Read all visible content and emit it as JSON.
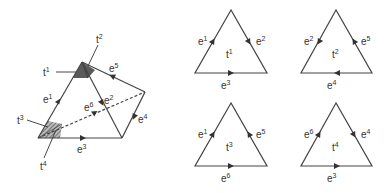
{
  "diagram": {
    "left_figure": {
      "vertices": {
        "A": [
          38,
          138
        ],
        "B": [
          82,
          62
        ],
        "C": [
          122,
          138
        ],
        "D": [
          145,
          92
        ]
      },
      "edges": [
        {
          "id": "e1",
          "label": "e",
          "sup": "1"
        },
        {
          "id": "e2",
          "label": "e",
          "sup": "2"
        },
        {
          "id": "e3",
          "label": "e",
          "sup": "3"
        },
        {
          "id": "e4",
          "label": "e",
          "sup": "4"
        },
        {
          "id": "e5",
          "label": "e",
          "sup": "5"
        },
        {
          "id": "e6",
          "label": "e",
          "sup": "6"
        }
      ],
      "corner_labels": [
        {
          "id": "t1",
          "label": "t",
          "sup": "1"
        },
        {
          "id": "t2",
          "label": "t",
          "sup": "2"
        },
        {
          "id": "t3",
          "label": "t",
          "sup": "3"
        },
        {
          "id": "t4",
          "label": "t",
          "sup": "4"
        }
      ]
    },
    "triangles": [
      {
        "name": "t",
        "sup": "1",
        "left": {
          "label": "e",
          "sup": "1"
        },
        "right": {
          "label": "e",
          "sup": "2"
        },
        "bottom": {
          "label": "e",
          "sup": "3"
        }
      },
      {
        "name": "t",
        "sup": "2",
        "left": {
          "label": "e",
          "sup": "2"
        },
        "right": {
          "label": "e",
          "sup": "5"
        },
        "bottom": {
          "label": "e",
          "sup": "4"
        }
      },
      {
        "name": "t",
        "sup": "3",
        "left": {
          "label": "e",
          "sup": "1"
        },
        "right": {
          "label": "e",
          "sup": "5"
        },
        "bottom": {
          "label": "e",
          "sup": "6"
        }
      },
      {
        "name": "t",
        "sup": "4",
        "left": {
          "label": "e",
          "sup": "6"
        },
        "right": {
          "label": "e",
          "sup": "4"
        },
        "bottom": {
          "label": "e",
          "sup": "3"
        }
      }
    ],
    "colors": {
      "line": "#444444",
      "text": "#333333",
      "shade_dark": "#555555",
      "shade_hatch": "#777777"
    }
  }
}
